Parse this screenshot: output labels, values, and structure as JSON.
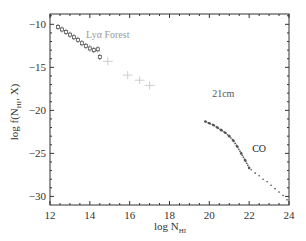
{
  "chart_data": {
    "type": "scatter",
    "title": "",
    "xlabel": "log N_HI",
    "ylabel": "log f(N_HI, X)",
    "xlim": [
      12,
      24
    ],
    "ylim": [
      -31,
      -8.8
    ],
    "xticks": [
      12,
      14,
      16,
      18,
      20,
      22,
      24
    ],
    "yticks": [
      -10,
      -15,
      -20,
      -25,
      -30
    ],
    "grid": false,
    "legend": null,
    "annotations": [
      {
        "text": "Lyα Forest",
        "x": 14.9,
        "y": -11.6,
        "color": "#9a9a9a"
      },
      {
        "text": "21cm",
        "x": 20.7,
        "y": -18.4,
        "color": "#555555"
      },
      {
        "text": "CO",
        "x": 22.5,
        "y": -24.8,
        "color": "#222222"
      }
    ],
    "series": [
      {
        "name": "Lyα Forest (measured)",
        "color": "#555555",
        "marker": "square-errorbar",
        "x": [
          12.4,
          12.6,
          12.8,
          13.0,
          13.2,
          13.4,
          13.6,
          13.8,
          14.0,
          14.2,
          14.4,
          14.5
        ],
        "y": [
          -10.3,
          -10.6,
          -10.9,
          -11.2,
          -11.5,
          -11.8,
          -12.2,
          -12.5,
          -12.8,
          -13.0,
          -12.9,
          -13.8
        ]
      },
      {
        "name": "Lyα Forest (extended)",
        "color": "#c8c8c8",
        "marker": "cross-errorbar",
        "x": [
          14.9,
          15.9,
          16.5,
          17.0
        ],
        "y": [
          -14.3,
          -15.9,
          -16.5,
          -17.1
        ]
      },
      {
        "name": "21cm",
        "color": "#555555",
        "marker": "dot",
        "x": [
          19.8,
          20.0,
          20.2,
          20.4,
          20.6,
          20.8,
          21.0,
          21.2,
          21.4,
          21.6,
          21.8,
          22.0
        ],
        "y": [
          -21.3,
          -21.5,
          -21.7,
          -22.0,
          -22.3,
          -22.6,
          -23.0,
          -23.5,
          -24.2,
          -25.0,
          -25.8,
          -26.7
        ]
      },
      {
        "name": "CO",
        "color": "#444444",
        "marker": "dot",
        "x": [
          22.1,
          22.3,
          22.5,
          22.7,
          22.9,
          23.1,
          23.3,
          23.5,
          23.7,
          23.9
        ],
        "y": [
          -26.9,
          -27.3,
          -27.6,
          -28.0,
          -28.3,
          -28.7,
          -29.1,
          -29.5,
          -29.9,
          -30.4
        ]
      }
    ]
  }
}
